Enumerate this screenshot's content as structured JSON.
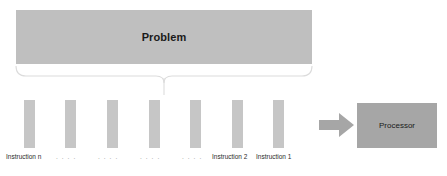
{
  "diagram": {
    "title_block": {
      "label": "Problem",
      "color": "#bfbfbf"
    },
    "brace": {
      "name": "decomposition-brace",
      "color": "#d9d9d9"
    },
    "instruction_bars": [
      {
        "label": "Instruction n",
        "center_x": 29
      },
      {
        "label": "",
        "center_x": 70
      },
      {
        "label": "",
        "center_x": 113
      },
      {
        "label": "",
        "center_x": 154
      },
      {
        "label": "",
        "center_x": 195
      },
      {
        "label": "Instruction 2",
        "center_x": 237
      },
      {
        "label": "Instruction 1",
        "center_x": 278
      }
    ],
    "bar_color": "#c6c6c6",
    "axis_labels": [
      {
        "text": "Instruction n",
        "x": 6
      },
      {
        "text": "Instruction 2",
        "x": 212
      },
      {
        "text": "Instruction 1",
        "x": 256
      }
    ],
    "ellipses": [
      {
        "text": ". . . .",
        "x": 56
      },
      {
        "text": ". . . .",
        "x": 98
      },
      {
        "text": ". . . .",
        "x": 140
      },
      {
        "text": ". . . .",
        "x": 182
      }
    ],
    "arrow": {
      "name": "flow-arrow-right",
      "color": "#a6a6a6"
    },
    "target_block": {
      "label": "Processor",
      "color": "#a6a6a6"
    }
  }
}
